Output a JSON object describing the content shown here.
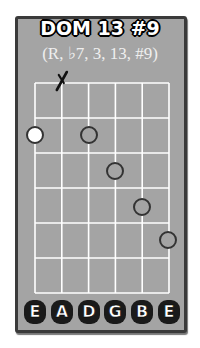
{
  "chord": {
    "name": "DOM 13 #9",
    "formula": "(R, ♭7, 3, 13, #9)"
  },
  "fretboard": {
    "strings": 6,
    "frets": 6,
    "grid": {
      "left": 35,
      "top": 83,
      "string_spacing": 26.8,
      "fret_spacing": 35
    },
    "colors": {
      "background": "#a4a4a4",
      "border": "#3a3a3a",
      "lines": "#ffffff",
      "root_fill": "#ffffff",
      "dot_stroke": "#333333"
    },
    "muted_strings": [
      {
        "string": 2,
        "symbol": "X"
      }
    ],
    "dots": [
      {
        "string": 1,
        "fret": 2,
        "type": "root",
        "x": 35,
        "y": 135
      },
      {
        "string": 3,
        "fret": 2,
        "type": "note",
        "x": 89,
        "y": 135
      },
      {
        "string": 4,
        "fret": 3,
        "type": "note",
        "x": 115,
        "y": 171
      },
      {
        "string": 5,
        "fret": 4,
        "type": "note",
        "x": 142,
        "y": 207
      },
      {
        "string": 6,
        "fret": 5,
        "type": "note",
        "x": 168,
        "y": 240
      }
    ]
  },
  "string_labels": [
    "E",
    "A",
    "D",
    "G",
    "B",
    "E"
  ]
}
